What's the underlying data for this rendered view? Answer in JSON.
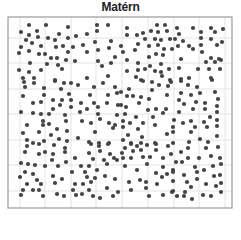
{
  "chart_data": {
    "type": "scatter",
    "title": "Matérn",
    "xlabel": "",
    "ylabel": "",
    "grid": true,
    "legend": null,
    "frame": {
      "x0": 8,
      "y0": 17,
      "x1": 232,
      "y1": 208
    },
    "grid_x": [
      20,
      45,
      71,
      96,
      122,
      148,
      174,
      199,
      225
    ],
    "grid_y": [
      38,
      63,
      89,
      114,
      140,
      165,
      191
    ],
    "point_color": "#444444",
    "grid_color": "#e3e3e3",
    "frame_color": "#9a9a9a",
    "point_radius": 2.1,
    "points": [
      [
        29,
        25
      ],
      [
        46,
        25
      ],
      [
        68,
        27
      ],
      [
        97,
        25
      ],
      [
        108,
        25
      ],
      [
        21,
        32
      ],
      [
        37,
        31
      ],
      [
        29,
        35
      ],
      [
        59,
        34
      ],
      [
        87,
        34
      ],
      [
        97,
        31
      ],
      [
        26,
        40
      ],
      [
        38,
        37
      ],
      [
        48,
        38
      ],
      [
        55,
        40
      ],
      [
        68,
        38
      ],
      [
        76,
        36
      ],
      [
        32,
        43
      ],
      [
        21,
        47
      ],
      [
        41,
        46
      ],
      [
        56,
        47
      ],
      [
        63,
        46
      ],
      [
        73,
        47
      ],
      [
        83,
        45
      ],
      [
        95,
        42
      ],
      [
        111,
        41
      ],
      [
        19,
        53
      ],
      [
        29,
        51
      ],
      [
        39,
        54
      ],
      [
        45,
        54
      ],
      [
        68,
        52
      ],
      [
        87,
        52
      ],
      [
        98,
        50
      ],
      [
        109,
        48
      ],
      [
        51,
        58
      ],
      [
        57,
        58
      ],
      [
        115,
        57
      ],
      [
        30,
        63
      ],
      [
        47,
        64
      ],
      [
        58,
        65
      ],
      [
        66,
        60
      ],
      [
        75,
        61
      ],
      [
        98,
        61
      ],
      [
        111,
        63
      ],
      [
        19,
        70
      ],
      [
        29,
        72
      ],
      [
        41,
        70
      ],
      [
        62,
        69
      ],
      [
        102,
        66
      ],
      [
        23,
        78
      ],
      [
        34,
        78
      ],
      [
        87,
        78
      ],
      [
        55,
        80
      ],
      [
        108,
        76
      ],
      [
        127,
        28
      ],
      [
        157,
        25
      ],
      [
        165,
        25
      ],
      [
        177,
        28
      ],
      [
        193,
        28
      ],
      [
        211,
        28
      ],
      [
        223,
        29
      ],
      [
        127,
        35
      ],
      [
        137,
        35
      ],
      [
        143,
        33
      ],
      [
        151,
        31
      ],
      [
        158,
        32
      ],
      [
        167,
        31
      ],
      [
        179,
        34
      ],
      [
        201,
        32
      ],
      [
        215,
        32
      ],
      [
        145,
        39
      ],
      [
        155,
        39
      ],
      [
        161,
        40
      ],
      [
        170,
        39
      ],
      [
        175,
        39
      ],
      [
        183,
        41
      ],
      [
        201,
        38
      ],
      [
        211,
        39
      ],
      [
        222,
        42
      ],
      [
        138,
        44
      ],
      [
        121,
        46
      ],
      [
        149,
        46
      ],
      [
        158,
        45
      ],
      [
        189,
        46
      ],
      [
        201,
        45
      ],
      [
        217,
        45
      ],
      [
        123,
        52
      ],
      [
        135,
        50
      ],
      [
        164,
        49
      ],
      [
        172,
        49
      ],
      [
        178,
        46
      ],
      [
        193,
        49
      ],
      [
        202,
        52
      ],
      [
        149,
        57
      ],
      [
        156,
        54
      ],
      [
        163,
        55
      ],
      [
        181,
        59
      ],
      [
        211,
        58
      ],
      [
        219,
        59
      ],
      [
        127,
        60
      ],
      [
        138,
        63
      ],
      [
        161,
        64
      ],
      [
        206,
        62
      ],
      [
        215,
        62
      ],
      [
        221,
        60
      ],
      [
        138,
        70
      ],
      [
        145,
        69
      ],
      [
        150,
        66
      ],
      [
        155,
        71
      ],
      [
        169,
        69
      ],
      [
        179,
        68
      ],
      [
        198,
        69
      ],
      [
        209,
        69
      ],
      [
        220,
        69
      ],
      [
        127,
        71
      ],
      [
        161,
        72
      ],
      [
        136,
        77
      ],
      [
        162,
        76
      ],
      [
        189,
        78
      ],
      [
        181,
        79
      ],
      [
        211,
        78
      ],
      [
        141,
        80
      ],
      [
        170,
        80
      ],
      [
        24,
        82
      ],
      [
        34,
        83
      ],
      [
        55,
        81
      ],
      [
        64,
        83
      ],
      [
        71,
        83
      ],
      [
        78,
        85
      ],
      [
        103,
        83
      ],
      [
        25,
        87
      ],
      [
        44,
        88
      ],
      [
        61,
        89
      ],
      [
        94,
        87
      ],
      [
        115,
        87
      ],
      [
        23,
        96
      ],
      [
        44,
        95
      ],
      [
        69,
        94
      ],
      [
        90,
        95
      ],
      [
        108,
        95
      ],
      [
        117,
        93
      ],
      [
        33,
        103
      ],
      [
        41,
        102
      ],
      [
        53,
        100
      ],
      [
        62,
        100
      ],
      [
        71,
        100
      ],
      [
        81,
        103
      ],
      [
        94,
        103
      ],
      [
        107,
        103
      ],
      [
        53,
        109
      ],
      [
        60,
        105
      ],
      [
        71,
        107
      ],
      [
        87,
        109
      ],
      [
        98,
        107
      ],
      [
        118,
        105
      ],
      [
        21,
        112
      ],
      [
        33,
        113
      ],
      [
        41,
        114
      ],
      [
        49,
        114
      ],
      [
        65,
        115
      ],
      [
        80,
        112
      ],
      [
        98,
        114
      ],
      [
        43,
        121
      ],
      [
        66,
        121
      ],
      [
        82,
        121
      ],
      [
        91,
        123
      ],
      [
        100,
        119
      ],
      [
        117,
        115
      ],
      [
        27,
        125
      ],
      [
        43,
        125
      ],
      [
        49,
        124
      ],
      [
        109,
        123
      ],
      [
        115,
        125
      ],
      [
        39,
        132
      ],
      [
        57,
        129
      ],
      [
        67,
        131
      ],
      [
        95,
        132
      ],
      [
        23,
        133
      ],
      [
        51,
        135
      ],
      [
        113,
        128
      ],
      [
        27,
        140
      ],
      [
        33,
        143
      ],
      [
        44,
        141
      ],
      [
        59,
        139
      ],
      [
        67,
        141
      ],
      [
        78,
        138
      ],
      [
        89,
        142
      ],
      [
        99,
        143
      ],
      [
        109,
        143
      ],
      [
        143,
        81
      ],
      [
        152,
        82
      ],
      [
        171,
        82
      ],
      [
        181,
        81
      ],
      [
        212,
        80
      ],
      [
        129,
        89
      ],
      [
        159,
        85
      ],
      [
        168,
        86
      ],
      [
        188,
        85
      ],
      [
        197,
        87
      ],
      [
        121,
        92
      ],
      [
        127,
        96
      ],
      [
        133,
        96
      ],
      [
        141,
        97
      ],
      [
        152,
        90
      ],
      [
        167,
        95
      ],
      [
        181,
        93
      ],
      [
        191,
        95
      ],
      [
        200,
        93
      ],
      [
        215,
        92
      ],
      [
        121,
        105
      ],
      [
        126,
        107
      ],
      [
        139,
        103
      ],
      [
        149,
        99
      ],
      [
        179,
        100
      ],
      [
        184,
        104
      ],
      [
        196,
        102
      ],
      [
        205,
        103
      ],
      [
        218,
        99
      ],
      [
        217,
        106
      ],
      [
        148,
        110
      ],
      [
        156,
        109
      ],
      [
        163,
        113
      ],
      [
        166,
        109
      ],
      [
        179,
        112
      ],
      [
        193,
        109
      ],
      [
        205,
        109
      ],
      [
        217,
        112
      ],
      [
        125,
        114
      ],
      [
        136,
        117
      ],
      [
        153,
        117
      ],
      [
        174,
        120
      ],
      [
        183,
        123
      ],
      [
        191,
        121
      ],
      [
        204,
        122
      ],
      [
        210,
        117
      ],
      [
        217,
        120
      ],
      [
        123,
        121
      ],
      [
        130,
        123
      ],
      [
        143,
        123
      ],
      [
        155,
        125
      ],
      [
        123,
        127
      ],
      [
        138,
        129
      ],
      [
        173,
        127
      ],
      [
        195,
        127
      ],
      [
        207,
        127
      ],
      [
        217,
        126
      ],
      [
        191,
        132
      ],
      [
        128,
        135
      ],
      [
        142,
        137
      ],
      [
        167,
        134
      ],
      [
        173,
        132
      ],
      [
        217,
        136
      ],
      [
        123,
        140
      ],
      [
        131,
        143
      ],
      [
        141,
        143
      ],
      [
        155,
        143
      ],
      [
        173,
        143
      ],
      [
        189,
        142
      ],
      [
        200,
        139
      ],
      [
        208,
        142
      ],
      [
        27,
        146
      ],
      [
        39,
        144
      ],
      [
        54,
        145
      ],
      [
        65,
        148
      ],
      [
        91,
        144
      ],
      [
        99,
        146
      ],
      [
        108,
        144
      ],
      [
        25,
        152
      ],
      [
        39,
        154
      ],
      [
        45,
        152
      ],
      [
        53,
        154
      ],
      [
        65,
        152
      ],
      [
        89,
        153
      ],
      [
        100,
        151
      ],
      [
        110,
        154
      ],
      [
        52,
        160
      ],
      [
        75,
        158
      ],
      [
        93,
        159
      ],
      [
        104,
        160
      ],
      [
        114,
        158
      ],
      [
        21,
        163
      ],
      [
        28,
        164
      ],
      [
        35,
        165
      ],
      [
        45,
        166
      ],
      [
        58,
        166
      ],
      [
        66,
        162
      ],
      [
        81,
        166
      ],
      [
        89,
        166
      ],
      [
        107,
        164
      ],
      [
        117,
        160
      ],
      [
        25,
        172
      ],
      [
        33,
        174
      ],
      [
        72,
        172
      ],
      [
        85,
        172
      ],
      [
        97,
        170
      ],
      [
        20,
        177
      ],
      [
        37,
        180
      ],
      [
        53,
        176
      ],
      [
        62,
        179
      ],
      [
        87,
        177
      ],
      [
        95,
        178
      ],
      [
        105,
        176
      ],
      [
        115,
        179
      ],
      [
        27,
        184
      ],
      [
        41,
        184
      ],
      [
        55,
        183
      ],
      [
        75,
        184
      ],
      [
        83,
        184
      ],
      [
        91,
        182
      ],
      [
        23,
        190
      ],
      [
        33,
        190
      ],
      [
        39,
        190
      ],
      [
        73,
        190
      ],
      [
        89,
        190
      ],
      [
        107,
        188
      ],
      [
        21,
        195
      ],
      [
        43,
        196
      ],
      [
        57,
        194
      ],
      [
        64,
        196
      ],
      [
        76,
        195
      ],
      [
        82,
        194
      ],
      [
        93,
        196
      ],
      [
        100,
        198
      ],
      [
        113,
        196
      ],
      [
        118,
        192
      ],
      [
        131,
        144
      ],
      [
        137,
        146
      ],
      [
        147,
        145
      ],
      [
        156,
        144
      ],
      [
        168,
        146
      ],
      [
        188,
        148
      ],
      [
        206,
        148
      ],
      [
        218,
        147
      ],
      [
        125,
        148
      ],
      [
        133,
        151
      ],
      [
        141,
        150
      ],
      [
        156,
        150
      ],
      [
        171,
        154
      ],
      [
        181,
        152
      ],
      [
        122,
        153
      ],
      [
        123,
        158
      ],
      [
        131,
        158
      ],
      [
        143,
        157
      ],
      [
        150,
        157
      ],
      [
        163,
        158
      ],
      [
        176,
        162
      ],
      [
        182,
        162
      ],
      [
        188,
        158
      ],
      [
        199,
        158
      ],
      [
        211,
        156
      ],
      [
        220,
        158
      ],
      [
        125,
        166
      ],
      [
        147,
        164
      ],
      [
        163,
        167
      ],
      [
        173,
        170
      ],
      [
        195,
        167
      ],
      [
        204,
        170
      ],
      [
        213,
        166
      ],
      [
        221,
        164
      ],
      [
        137,
        170
      ],
      [
        156,
        173
      ],
      [
        162,
        177
      ],
      [
        167,
        174
      ],
      [
        173,
        172
      ],
      [
        184,
        175
      ],
      [
        197,
        172
      ],
      [
        214,
        176
      ],
      [
        220,
        175
      ],
      [
        129,
        182
      ],
      [
        140,
        180
      ],
      [
        146,
        182
      ],
      [
        157,
        184
      ],
      [
        173,
        181
      ],
      [
        187,
        182
      ],
      [
        197,
        179
      ],
      [
        206,
        184
      ],
      [
        216,
        186
      ],
      [
        221,
        183
      ],
      [
        131,
        190
      ],
      [
        146,
        188
      ],
      [
        173,
        191
      ],
      [
        191,
        187
      ],
      [
        149,
        196
      ],
      [
        163,
        195
      ],
      [
        172,
        192
      ],
      [
        177,
        196
      ],
      [
        184,
        196
      ],
      [
        185,
        192
      ],
      [
        203,
        195
      ],
      [
        211,
        196
      ],
      [
        221,
        192
      ],
      [
        192,
        199
      ]
    ]
  }
}
